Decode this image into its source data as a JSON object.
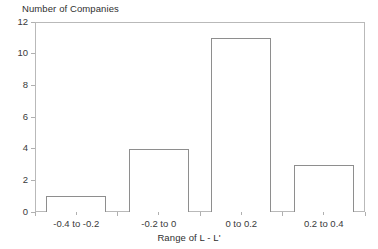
{
  "chart_data": {
    "type": "bar",
    "title": "",
    "ylabel": "Number of Companies",
    "xlabel": "Range of L - L'",
    "categories": [
      "-0.4 to -0.2",
      "-0.2 to 0",
      "0 to 0.2",
      "0.2 to 0.4"
    ],
    "values": [
      1,
      4,
      11,
      3
    ],
    "ylim": [
      0,
      12
    ],
    "ytick_labels": [
      "0",
      "2",
      "4",
      "6",
      "8",
      "10",
      "12"
    ],
    "ytick_values": [
      0,
      2,
      4,
      6,
      8,
      10,
      12
    ],
    "grid": false,
    "legend": false,
    "bar_fill_color": "#ffffff",
    "bar_edge_color": "#8e8e8e",
    "axis_color": "#b9b9b9",
    "text_color": "#3a3a3a"
  }
}
